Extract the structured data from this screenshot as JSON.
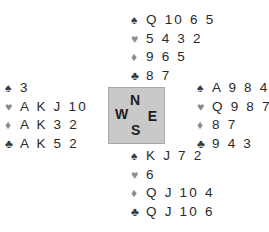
{
  "suits": {
    "spades": {
      "symbol": "♠",
      "color": "#3a3a3a"
    },
    "hearts": {
      "symbol": "♥",
      "color": "#8a8a8a"
    },
    "diamonds": {
      "symbol": "♦",
      "color": "#8a8a8a"
    },
    "clubs": {
      "symbol": "♣",
      "color": "#3a3a3a"
    }
  },
  "compass": {
    "north": "N",
    "south": "S",
    "east": "E",
    "west": "W"
  },
  "hands": {
    "north": {
      "spades": "Q 10 6 5",
      "hearts": "5 4 3 2",
      "diamonds": "9 6 5",
      "clubs": "8 7"
    },
    "west": {
      "spades": "3",
      "hearts": "A K J 10",
      "diamonds": "A K 3 2",
      "clubs": "A K 5 2"
    },
    "east": {
      "spades": "A 9 8 4",
      "hearts": "Q 9 8 7",
      "diamonds": "8 7",
      "clubs": "9 4 3"
    },
    "south": {
      "spades": "K J 7 2",
      "hearts": "6",
      "diamonds": "Q J 10 4",
      "clubs": "Q J 10 6"
    }
  }
}
